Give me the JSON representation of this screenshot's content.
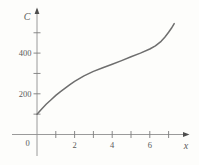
{
  "figure": {
    "background": "#fdfdfb",
    "axis_color": "#8f8f8f",
    "tick_color": "#7d7d7d",
    "curve_color": "#6e6e6e",
    "label_color": "#5a5a5a",
    "arrow_color": "#4d4d4d"
  },
  "chart_data": {
    "type": "line",
    "title": "",
    "xlabel": "x",
    "ylabel": "C",
    "origin_label": "0",
    "xlim": [
      0,
      7.6
    ],
    "ylim": [
      0,
      600
    ],
    "x_ticks_all": [
      1,
      2,
      3,
      4,
      5,
      6,
      7
    ],
    "x_ticks_labeled": [
      2,
      4,
      6
    ],
    "y_ticks_all": [
      100,
      200,
      300,
      400,
      500
    ],
    "y_ticks_labeled": [
      200,
      400
    ],
    "grid": "off",
    "legend": "none",
    "series": [
      {
        "name": "C(x)",
        "x": [
          0,
          0.25,
          0.5,
          0.75,
          1,
          1.25,
          1.5,
          1.75,
          2,
          2.5,
          3,
          3.5,
          4,
          4.5,
          5,
          5.5,
          6,
          6.3,
          6.6,
          6.8,
          7,
          7.15,
          7.3
        ],
        "y": [
          100,
          126,
          150,
          171,
          192,
          211,
          228,
          245,
          261,
          288,
          310,
          328,
          345,
          363,
          382,
          400,
          420,
          436,
          458,
          478,
          502,
          522,
          545
        ]
      }
    ]
  }
}
